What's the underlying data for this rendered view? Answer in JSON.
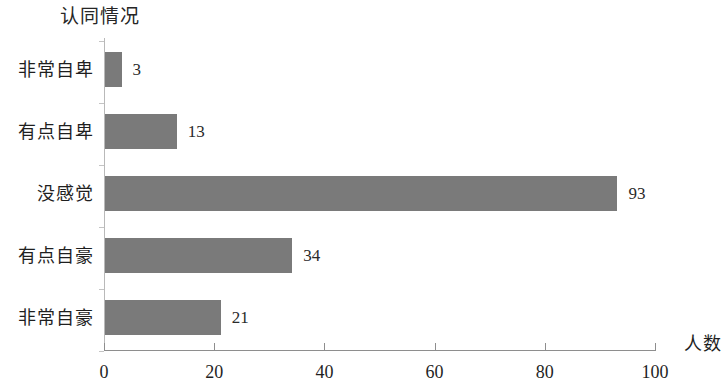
{
  "chart_data": {
    "type": "bar",
    "orientation": "horizontal",
    "title": "认同情况",
    "xlabel": "人数",
    "ylabel": "",
    "categories": [
      "非常自卑",
      "有点自卑",
      "没感觉",
      "有点自豪",
      "非常自豪"
    ],
    "values": [
      3,
      13,
      93,
      34,
      21
    ],
    "value_labels": [
      "3",
      "13",
      "93",
      "34",
      "21"
    ],
    "xlim": [
      0,
      100
    ],
    "xticks": [
      0,
      20,
      40,
      60,
      80,
      100
    ],
    "xtick_labels": [
      "0",
      "20",
      "40",
      "60",
      "80",
      "100"
    ],
    "grid": false,
    "legend": false,
    "bar_color": "#7a7a7a",
    "axis_color": "#8e8e8e",
    "background_color": "#ffffff"
  }
}
